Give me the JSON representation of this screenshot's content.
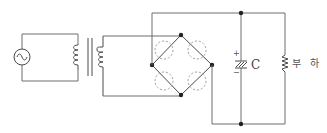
{
  "diagram": {
    "type": "bridge-rectifier-circuit",
    "components": {
      "source": {
        "kind": "ac-source",
        "icon": "sine-wave-icon"
      },
      "transformer": {
        "kind": "transformer",
        "primary_coil_turns": 4,
        "secondary_coil_turns": 4
      },
      "bridge": {
        "kind": "diode-bridge-placeholder",
        "diode_slots": 4,
        "nodes": 4
      },
      "capacitor": {
        "kind": "capacitor",
        "label": "C",
        "plus_sign": "+",
        "minus_sign": "−"
      },
      "load": {
        "kind": "resistor",
        "label": "부 하"
      }
    },
    "colors": {
      "wire": "#6e6e6e",
      "node": "#222222",
      "dashed": "#9a9a9a",
      "text": "#444444"
    }
  }
}
